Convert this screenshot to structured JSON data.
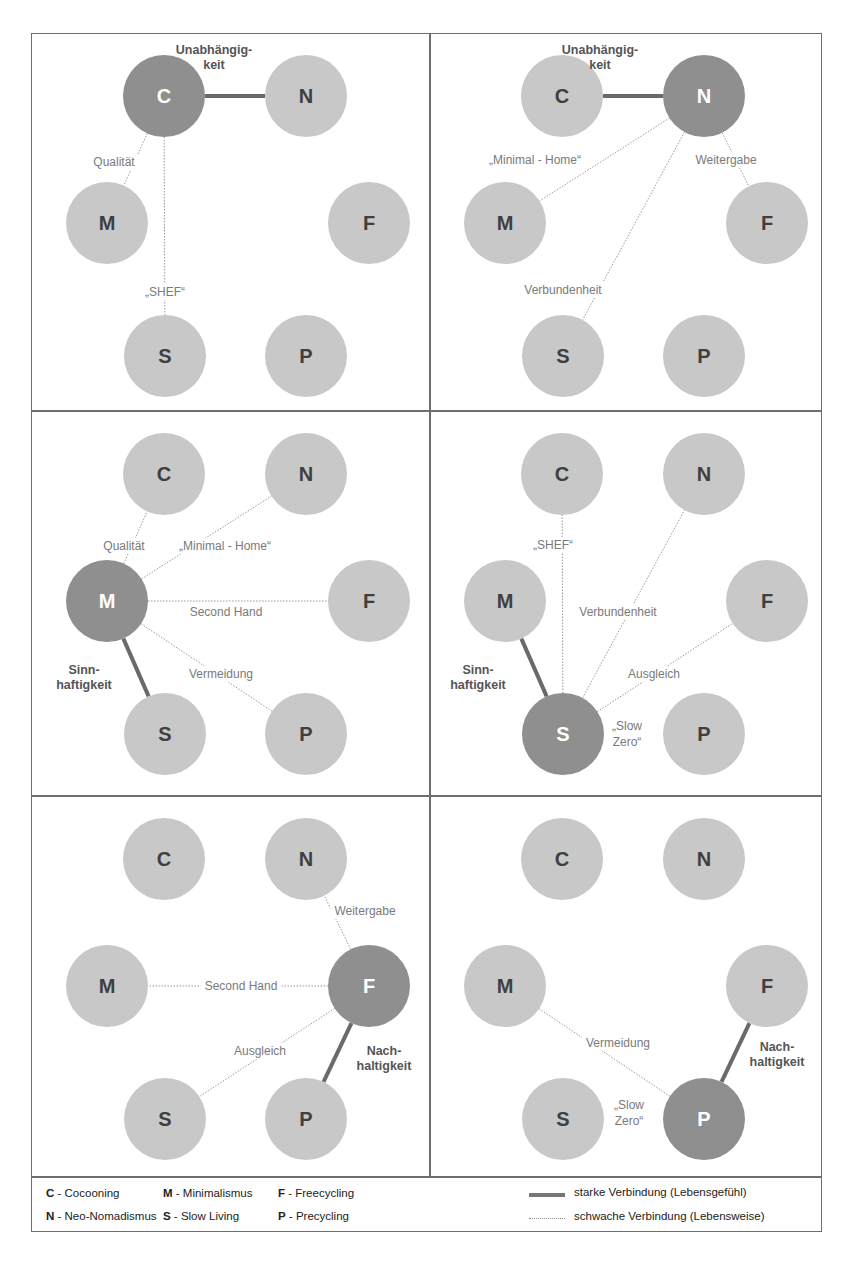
{
  "colors": {
    "node_default": "#c8c8c8",
    "node_active": "#8f8f8f",
    "node_text_default": "#3f3f3f",
    "node_text_active": "#ffffff",
    "strong_edge": "#6a6a6a",
    "weak_edge": "#9a9a9a",
    "frame": "#6e6e6e"
  },
  "node_positions": {
    "C": [
      132,
      62
    ],
    "N": [
      274,
      62
    ],
    "M": [
      75,
      189
    ],
    "F": [
      337,
      189
    ],
    "S": [
      133,
      322
    ],
    "P": [
      274,
      322
    ]
  },
  "node_radius": 41,
  "panels": [
    {
      "focus": "C",
      "strong": [
        {
          "from": "C",
          "to": "N",
          "label": [
            "Unabhängig-",
            "keit"
          ],
          "label_pos": [
            182,
            20
          ]
        }
      ],
      "weak": [
        {
          "from": "C",
          "to": "M",
          "label": "Qualität",
          "label_pos": [
            82,
            128
          ]
        },
        {
          "from": "C",
          "to": "S",
          "label": "„SHEF“",
          "label_pos": [
            133,
            258
          ]
        }
      ],
      "extra_labels": []
    },
    {
      "focus": "N",
      "strong": [
        {
          "from": "C",
          "to": "N",
          "label": [
            "Unabhängig-",
            "keit"
          ],
          "label_pos": [
            170,
            20
          ]
        }
      ],
      "weak": [
        {
          "from": "N",
          "to": "M",
          "label": "„Minimal - Home“",
          "label_pos": [
            105,
            126
          ]
        },
        {
          "from": "N",
          "to": "F",
          "label": "Weitergabe",
          "label_pos": [
            296,
            126
          ]
        },
        {
          "from": "N",
          "to": "S",
          "label": "Verbundenheit",
          "label_pos": [
            133,
            256
          ]
        }
      ],
      "extra_labels": []
    },
    {
      "focus": "M",
      "strong": [
        {
          "from": "M",
          "to": "S",
          "label": [
            "Sinn-",
            "haftigkeit"
          ],
          "label_pos": [
            52,
            262
          ]
        }
      ],
      "weak": [
        {
          "from": "M",
          "to": "C",
          "label": "Qualität",
          "label_pos": [
            92,
            134
          ]
        },
        {
          "from": "M",
          "to": "N",
          "label": "„Minimal - Home“",
          "label_pos": [
            193,
            134
          ]
        },
        {
          "from": "M",
          "to": "F",
          "label": "Second Hand",
          "label_pos": [
            194,
            200
          ]
        },
        {
          "from": "M",
          "to": "P",
          "label": "Vermeidung",
          "label_pos": [
            189,
            262
          ]
        }
      ],
      "extra_labels": []
    },
    {
      "focus": "S",
      "strong": [
        {
          "from": "M",
          "to": "S",
          "label": [
            "Sinn-",
            "haftigkeit"
          ],
          "label_pos": [
            48,
            262
          ]
        }
      ],
      "weak": [
        {
          "from": "S",
          "to": "C",
          "label": "„SHEF“",
          "label_pos": [
            123,
            133
          ]
        },
        {
          "from": "S",
          "to": "N",
          "label": "Verbundenheit",
          "label_pos": [
            188,
            200
          ]
        },
        {
          "from": "S",
          "to": "F",
          "label": "Ausgleich",
          "label_pos": [
            224,
            262
          ]
        }
      ],
      "extra_labels": [
        {
          "text": [
            "„Slow",
            "Zero“"
          ],
          "pos": [
            197,
            318
          ]
        }
      ]
    },
    {
      "focus": "F",
      "strong": [
        {
          "from": "F",
          "to": "P",
          "label": [
            "Nach-",
            "haltigkeit"
          ],
          "label_pos": [
            352,
            258
          ]
        }
      ],
      "weak": [
        {
          "from": "F",
          "to": "N",
          "label": "Weitergabe",
          "label_pos": [
            333,
            114
          ]
        },
        {
          "from": "F",
          "to": "M",
          "label": "Second Hand",
          "label_pos": [
            209,
            189
          ]
        },
        {
          "from": "F",
          "to": "S",
          "label": "Ausgleich",
          "label_pos": [
            228,
            254
          ]
        }
      ],
      "extra_labels": []
    },
    {
      "focus": "P",
      "strong": [
        {
          "from": "F",
          "to": "P",
          "label": [
            "Nach-",
            "haltigkeit"
          ],
          "label_pos": [
            347,
            254
          ]
        }
      ],
      "weak": [
        {
          "from": "P",
          "to": "M",
          "label": "Vermeidung",
          "label_pos": [
            188,
            246
          ]
        }
      ],
      "extra_labels": [
        {
          "text": [
            "„Slow",
            "Zero“"
          ],
          "pos": [
            199,
            312
          ]
        }
      ]
    }
  ],
  "legend": {
    "items": [
      {
        "key": "C",
        "label": " - Cocooning"
      },
      {
        "key": "N",
        "label": " - Neo-Nomadismus"
      },
      {
        "key": "M",
        "label": " - Minimalismus"
      },
      {
        "key": "S",
        "label": " - Slow Living"
      },
      {
        "key": "F",
        "label": " - Freecycling"
      },
      {
        "key": "P",
        "label": " - Precycling"
      }
    ],
    "strong_label": "starke Verbindung (Lebensgefühl)",
    "weak_label": "schwache Verbindung (Lebensweise)"
  }
}
